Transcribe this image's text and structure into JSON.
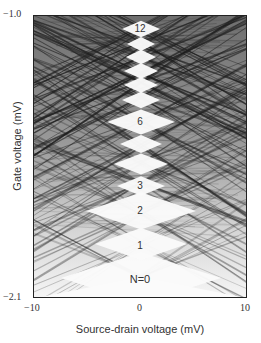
{
  "chart_data": {
    "type": "heatmap",
    "title": "",
    "xlabel": "Source-drain voltage (mV)",
    "ylabel": "Gate voltage (mV)",
    "xlim": [
      -10,
      10
    ],
    "ylim": [
      -2.1,
      -1.0
    ],
    "x_ticks": [
      "−10",
      "0",
      "10"
    ],
    "y_ticks": [
      "−1.0",
      "−2.1"
    ],
    "grid": false,
    "legend": null,
    "annotations": [
      "12",
      "6",
      "3",
      "2",
      "1",
      "N=0"
    ],
    "diamonds": [
      {
        "N": 0,
        "center_y_px": 277,
        "half_width_px": 80,
        "label": "N=0"
      },
      {
        "N": 1,
        "center_y_px": 243,
        "half_width_px": 46,
        "label": "1"
      },
      {
        "N": 2,
        "center_y_px": 210,
        "half_width_px": 55,
        "label": "2"
      },
      {
        "N": 3,
        "center_y_px": 185,
        "half_width_px": 24,
        "label": "3"
      },
      {
        "N": 4,
        "center_y_px": 163,
        "half_width_px": 27,
        "label": ""
      },
      {
        "N": 5,
        "center_y_px": 143,
        "half_width_px": 21,
        "label": ""
      },
      {
        "N": 6,
        "center_y_px": 121,
        "half_width_px": 34,
        "label": "6"
      },
      {
        "N": 7,
        "center_y_px": 99,
        "half_width_px": 19,
        "label": ""
      },
      {
        "N": 8,
        "center_y_px": 84,
        "half_width_px": 17,
        "label": ""
      },
      {
        "N": 9,
        "center_y_px": 70,
        "half_width_px": 17,
        "label": ""
      },
      {
        "N": 10,
        "center_y_px": 56,
        "half_width_px": 15,
        "label": ""
      },
      {
        "N": 11,
        "center_y_px": 43,
        "half_width_px": 14,
        "label": ""
      },
      {
        "N": 12,
        "center_y_px": 28,
        "half_width_px": 19,
        "label": "12"
      }
    ]
  },
  "axes": {
    "x_tick_left": "−10",
    "x_tick_mid": "0",
    "x_tick_right": "10",
    "y_tick_top": "−1.0",
    "y_tick_bottom": "−2.1",
    "xlabel": "Source-drain voltage (mV)",
    "ylabel": "Gate voltage (mV)"
  },
  "labels": {
    "n12": "12",
    "n6": "6",
    "n3": "3",
    "n2": "2",
    "n1": "1",
    "n0": "N=0"
  },
  "colors": {
    "background": "#ffffff",
    "frame": "#222222",
    "dark_line": "#2a2a2a",
    "mid_grey": "#8a8a8a"
  }
}
